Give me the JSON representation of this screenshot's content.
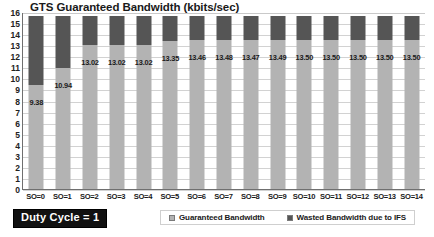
{
  "chart_data": {
    "type": "bar",
    "stacked": true,
    "title": "GTS Guaranteed Bandwidth (kbits/sec)",
    "xlabel": "",
    "ylabel": "",
    "ylim": [
      0,
      16
    ],
    "ytick_step": 1,
    "yticks": [
      "16",
      "15",
      "14",
      "13",
      "12",
      "11",
      "10",
      "9",
      "8",
      "7",
      "6",
      "5",
      "4",
      "3",
      "2",
      "1",
      "0"
    ],
    "grid": true,
    "legend_position": "bottom",
    "categories": [
      "SO=0",
      "SO=1",
      "SO=2",
      "SO=3",
      "SO=4",
      "SO=5",
      "SO=6",
      "SO=7",
      "SO=8",
      "SO=9",
      "SO=10",
      "SO=11",
      "SO=12",
      "SO=13",
      "SO=14"
    ],
    "series": [
      {
        "name": "Guaranteed Bandwidth",
        "color": "#b3b3b3",
        "values": [
          9.38,
          10.94,
          13.02,
          13.02,
          13.02,
          13.35,
          13.46,
          13.48,
          13.47,
          13.49,
          13.5,
          13.5,
          13.5,
          13.5,
          13.5
        ]
      },
      {
        "name": "Wasted Bandwidth due to IFS",
        "color": "#555555",
        "values": [
          6.22,
          4.66,
          2.58,
          2.58,
          2.58,
          2.25,
          2.14,
          2.12,
          2.13,
          2.11,
          2.1,
          2.1,
          2.1,
          2.1,
          2.1
        ]
      }
    ],
    "total_top": 15.6,
    "data_labels": [
      "9.38",
      "10.94",
      "13.02",
      "13.02",
      "13.02",
      "13.35",
      "13.46",
      "13.48",
      "13.47",
      "13.49",
      "13.50",
      "13.50",
      "13.50",
      "13.50",
      "13.50"
    ],
    "data_label_series": "Guaranteed Bandwidth",
    "annotations": [
      {
        "name": "duty-cycle",
        "text": "Duty Cycle = 1"
      }
    ]
  },
  "badge": {
    "duty_cycle_label": "Duty Cycle = 1"
  },
  "legend": {
    "items": [
      {
        "label": "Guaranteed Bandwidth",
        "color": "#b3b3b3"
      },
      {
        "label": "Wasted Bandwidth due to IFS",
        "color": "#555555"
      }
    ]
  },
  "colors": {
    "guaranteed": "#b3b3b3",
    "wasted": "#555555",
    "grid": "#d2d2d2",
    "axis": "#6f6f6f",
    "text": "#1a1a1a",
    "badge_bg": "#111111",
    "badge_fg": "#ffffff"
  }
}
